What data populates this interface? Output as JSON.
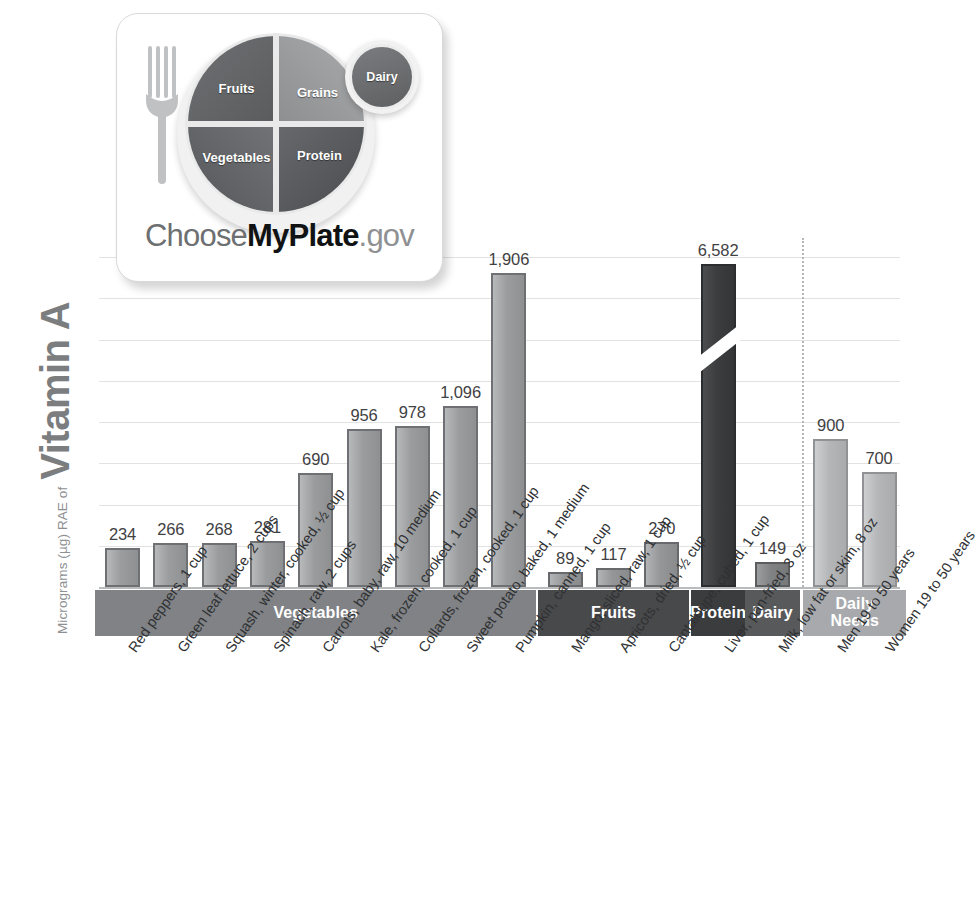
{
  "axis": {
    "y_title_small": "Micrograms (µg) RAE of",
    "y_title_big": "Vitamin A"
  },
  "logo": {
    "name": "myplate-logo",
    "fruits": "Fruits",
    "grains": "Grains",
    "vegetables": "Vegetables",
    "protein": "Protein",
    "dairy": "Dairy",
    "wordmark_1": "Choose",
    "wordmark_2": "MyPlate",
    "wordmark_3": ".gov"
  },
  "bands": [
    {
      "label": "Vegetables",
      "color": "#808285"
    },
    {
      "label": "Fruits",
      "color": "#48494b"
    },
    {
      "label": "Protein",
      "color": "#3b3c3e"
    },
    {
      "label": "Dairy",
      "color": "#58595b"
    },
    {
      "label": "Daily\nNeeds",
      "color": "#a7a9ac"
    }
  ],
  "chart_data": {
    "type": "bar",
    "xlabel": "",
    "ylabel": "Micrograms (µg) RAE of Vitamin A",
    "ylim": [
      0,
      2000
    ],
    "grid": true,
    "legend": "none",
    "axis_break": {
      "bar": "Liver, pan-fried, 3 oz",
      "note": "value axis broken; bar truncated"
    },
    "gridline_values": [
      0,
      250,
      500,
      750,
      1000,
      1250,
      1500,
      1750,
      2000
    ],
    "categories": [
      "Red peppers, 1 cup",
      "Green leaf lettuce, 2 cups",
      "Squash, winter, cooked, ½ cup",
      "Spinach, raw, 2 cups",
      "Carrots, baby, raw, 10 medium",
      "Kale, frozen, cooked, 1 cup",
      "Collards, frozen, cooked, 1 cup",
      "Sweet potato, baked, 1 medium",
      "Pumpkin, canned, 1 cup",
      "Mango, sliced, raw, 1 cup",
      "Apricots, dried, ½ cup",
      "Cantaloupe, cubed, 1 cup",
      "Liver, pan-fried, 3 oz",
      "Milk, low fat or skim, 8 oz",
      "Men 19 to 50 years",
      "Women 19 to 50 years"
    ],
    "values": [
      234,
      266,
      268,
      281,
      690,
      956,
      978,
      1096,
      1906,
      89,
      117,
      270,
      6582,
      149,
      900,
      700
    ],
    "value_labels": [
      "234",
      "266",
      "268",
      "281",
      "690",
      "956",
      "978",
      "1,096",
      "1,906",
      "89",
      "117",
      "270",
      "6,582",
      "149",
      "900",
      "700"
    ],
    "groups": [
      "veg",
      "veg",
      "veg",
      "veg",
      "veg",
      "veg",
      "veg",
      "veg",
      "veg",
      "fruit",
      "fruit",
      "fruit",
      "protein",
      "dairy",
      "needs",
      "needs"
    ]
  }
}
